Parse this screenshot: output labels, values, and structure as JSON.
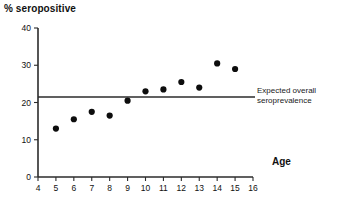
{
  "chart_data": {
    "type": "scatter",
    "title": "",
    "xlabel": "Age",
    "ylabel": "% seropositive",
    "xlim": [
      4,
      16
    ],
    "ylim": [
      0,
      40
    ],
    "grid": false,
    "legend": "none",
    "x": [
      5,
      6,
      7,
      8,
      9,
      10,
      11,
      12,
      13,
      14,
      15
    ],
    "values": [
      13,
      15.5,
      17.5,
      16.5,
      20.5,
      23,
      23.5,
      25.5,
      24,
      30.5,
      29
    ],
    "series": [
      {
        "name": "Observed seropositive",
        "x": [
          5,
          6,
          7,
          8,
          9,
          10,
          11,
          12,
          13,
          14,
          15
        ],
        "values": [
          13,
          15.5,
          17.5,
          16.5,
          20.5,
          23,
          23.5,
          25.5,
          24,
          30.5,
          29
        ]
      }
    ],
    "xticks": [
      4,
      5,
      6,
      7,
      8,
      9,
      10,
      11,
      12,
      13,
      14,
      15,
      16
    ],
    "xtick_labels": [
      "4",
      "5",
      "6",
      "7",
      "8",
      "9",
      "10",
      "11",
      "12",
      "13",
      "14",
      "15",
      "16"
    ],
    "yticks": [
      0,
      10,
      20,
      30,
      40
    ],
    "ytick_labels": [
      "0",
      "10",
      "20",
      "30",
      "40"
    ],
    "reference_line": {
      "value": 21.5,
      "label_line1": "Expected overall",
      "label_line2": "seroprevalence",
      "orientation": "horizontal"
    },
    "marker_color": "#0d0d0d",
    "axis_color": "#2b2b2b"
  },
  "labels": {
    "y_axis_title": "% seropositive",
    "x_axis_title": "Age",
    "annotation_line1": "Expected overall",
    "annotation_line2": "seroprevalence"
  }
}
